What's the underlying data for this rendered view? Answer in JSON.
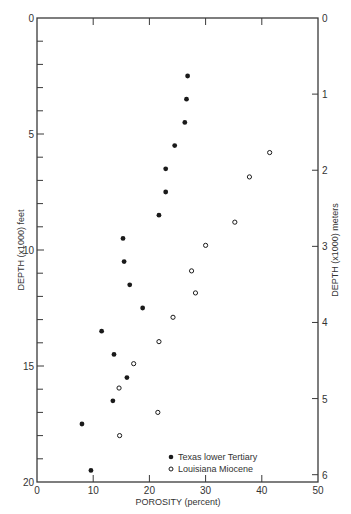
{
  "chart_data": {
    "type": "scatter",
    "title": "",
    "xlabel": "POROSITY (percent)",
    "ylabel": "DEPTH (x1000) feet",
    "ylabel_right": "DEPTH (x1000) meters",
    "xlim": [
      0,
      50
    ],
    "ylim": [
      0,
      20
    ],
    "ylim_right": [
      0,
      6.096
    ],
    "y_inverted": true,
    "grid": false,
    "x_ticks": [
      0,
      10,
      20,
      30,
      40,
      50
    ],
    "y_ticks_labeled": [
      0,
      5,
      10,
      15,
      20
    ],
    "y_ticks_minor": [
      1,
      2,
      3,
      4,
      6,
      7,
      8,
      9,
      11,
      12,
      13,
      14,
      16,
      17,
      18,
      19
    ],
    "y_right_ticks": [
      0,
      1,
      2,
      3,
      4,
      5,
      6
    ],
    "legend_position": "lower right",
    "series": [
      {
        "name": "Texas lower Tertiary",
        "marker": "filled-circle",
        "points": [
          {
            "porosity": 26.8,
            "depth_kft": 2.5
          },
          {
            "porosity": 26.6,
            "depth_kft": 3.5
          },
          {
            "porosity": 26.3,
            "depth_kft": 4.5
          },
          {
            "porosity": 24.5,
            "depth_kft": 5.5
          },
          {
            "porosity": 22.9,
            "depth_kft": 6.5
          },
          {
            "porosity": 22.9,
            "depth_kft": 7.5
          },
          {
            "porosity": 21.7,
            "depth_kft": 8.5
          },
          {
            "porosity": 15.3,
            "depth_kft": 9.5
          },
          {
            "porosity": 15.5,
            "depth_kft": 10.5
          },
          {
            "porosity": 16.5,
            "depth_kft": 11.5
          },
          {
            "porosity": 18.8,
            "depth_kft": 12.5
          },
          {
            "porosity": 11.5,
            "depth_kft": 13.5
          },
          {
            "porosity": 13.7,
            "depth_kft": 14.5
          },
          {
            "porosity": 16.0,
            "depth_kft": 15.5
          },
          {
            "porosity": 13.5,
            "depth_kft": 16.5
          },
          {
            "porosity": 8.0,
            "depth_kft": 17.5
          },
          {
            "porosity": 9.6,
            "depth_kft": 19.5
          }
        ]
      },
      {
        "name": "Louisiana Miocene",
        "marker": "open-circle",
        "points": [
          {
            "porosity": 41.4,
            "depth_kft": 5.8
          },
          {
            "porosity": 37.8,
            "depth_kft": 6.85
          },
          {
            "porosity": 35.2,
            "depth_kft": 8.8
          },
          {
            "porosity": 30.0,
            "depth_kft": 9.8
          },
          {
            "porosity": 27.5,
            "depth_kft": 10.9
          },
          {
            "porosity": 28.2,
            "depth_kft": 11.85
          },
          {
            "porosity": 24.2,
            "depth_kft": 12.9
          },
          {
            "porosity": 21.7,
            "depth_kft": 13.95
          },
          {
            "porosity": 17.2,
            "depth_kft": 14.9
          },
          {
            "porosity": 14.6,
            "depth_kft": 15.95
          },
          {
            "porosity": 21.5,
            "depth_kft": 17.0
          },
          {
            "porosity": 14.7,
            "depth_kft": 18.0
          }
        ]
      }
    ]
  },
  "labels": {
    "x_axis": "POROSITY (percent)",
    "y_axis_left": "DEPTH (x1000) feet",
    "y_axis_right": "DEPTH (x1000) meters",
    "legend_texas": "Texas lower Tertiary",
    "legend_louisiana": "Louisiana Miocene"
  },
  "colors": {
    "axis": "#3a3a3a",
    "marker": "#1a1a1a",
    "background": "#ffffff"
  }
}
